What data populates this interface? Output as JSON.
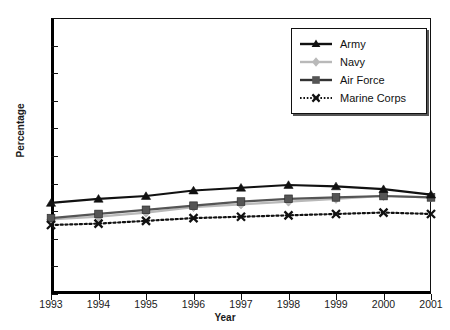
{
  "chart_data": {
    "type": "line",
    "title": "",
    "xlabel": "Year",
    "ylabel": "Percentage",
    "x": [
      1993,
      1994,
      1995,
      1996,
      1997,
      1998,
      1999,
      2000,
      2001
    ],
    "categories": [
      "1993",
      "1994",
      "1995",
      "1996",
      "1997",
      "1998",
      "1999",
      "2000",
      "2001"
    ],
    "xlim": [
      1993,
      2001
    ],
    "ylim": [
      0,
      100
    ],
    "yticks": [
      0,
      10,
      20,
      30,
      40,
      50,
      60,
      70,
      80,
      90,
      100
    ],
    "ytick_labels": [
      "0",
      "10",
      "20",
      "30",
      "40",
      "50",
      "60",
      "70",
      "80",
      "90",
      "100"
    ],
    "grid": false,
    "legend_position": "top-right",
    "series": [
      {
        "name": "Army",
        "color": "#111111",
        "marker": "triangle",
        "linestyle": "solid",
        "values": [
          33,
          34.5,
          35.5,
          37.5,
          38.5,
          39.5,
          39,
          38,
          36
        ]
      },
      {
        "name": "Navy",
        "color": "#b9b9b9",
        "marker": "diamond",
        "linestyle": "solid",
        "values": [
          27,
          28,
          29.5,
          31.5,
          32.5,
          33.5,
          34.5,
          35.5,
          35
        ]
      },
      {
        "name": "Air Force",
        "color": "#555555",
        "marker": "square",
        "linestyle": "solid",
        "values": [
          27.5,
          29,
          30.5,
          32,
          33.5,
          34.5,
          35,
          35.5,
          35
        ]
      },
      {
        "name": "Marine Corps",
        "color": "#111111",
        "marker": "x",
        "linestyle": "dotted",
        "values": [
          25,
          25.5,
          26.5,
          27.5,
          28,
          28.5,
          29,
          29.5,
          29
        ]
      }
    ]
  },
  "legend": {
    "items": [
      {
        "label": "Army"
      },
      {
        "label": "Navy"
      },
      {
        "label": "Air Force"
      },
      {
        "label": "Marine Corps"
      }
    ]
  }
}
